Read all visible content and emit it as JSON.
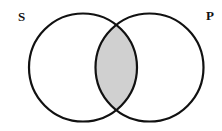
{
  "diagram": {
    "type": "venn",
    "sets": [
      {
        "id": "S",
        "label": "S",
        "cx": 83,
        "cy": 67.5,
        "r": 54
      },
      {
        "id": "P",
        "label": "P",
        "cx": 149.5,
        "cy": 67.5,
        "r": 54
      }
    ],
    "shaded_regions": [
      "S∩P"
    ],
    "colors": {
      "stroke": "#111111",
      "shade": "#d0d0d0",
      "background": "#ffffff"
    }
  }
}
